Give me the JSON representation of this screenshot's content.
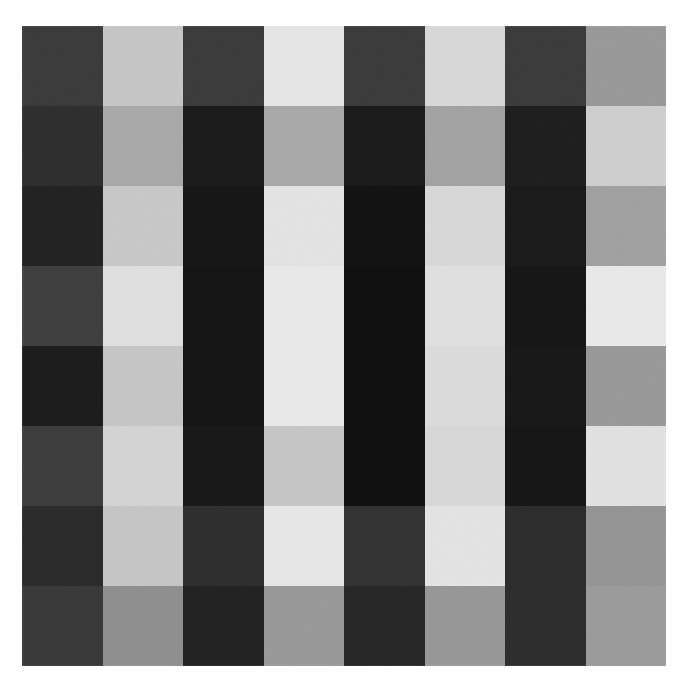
{
  "figure": {
    "caption": "",
    "background_color": "#ffffff",
    "plate": {
      "left": 22,
      "top": 26,
      "width": 644,
      "height": 640,
      "rows": 8,
      "cols": 8
    }
  },
  "palette": {
    "darkest": "#151515",
    "dark": "#2e2e2e",
    "mid_dark": "#3d3d3d",
    "mid": "#808080",
    "mid_light": "#a9a9a9",
    "light": "#c8c8c8",
    "lightest": "#ececec",
    "paper": "#ffffff"
  },
  "chart_data": {
    "type": "heatmap",
    "xlabel": "",
    "ylabel": "",
    "x": [
      "c1",
      "c2",
      "c3",
      "c4",
      "c5",
      "c6",
      "c7",
      "c8"
    ],
    "y": [
      "r1",
      "r2",
      "r3",
      "r4",
      "r5",
      "r6",
      "r7",
      "r8"
    ],
    "grid": false,
    "legend": "none",
    "value_range": [
      8,
      240
    ],
    "colormap": "grayscale",
    "column_phase": [
      "dark",
      "light",
      "dark",
      "light",
      "dark",
      "light",
      "dark",
      "light"
    ],
    "row_contrast": [
      0.55,
      0.8,
      0.95,
      1.0,
      1.0,
      0.95,
      0.78,
      0.52
    ],
    "values": [
      [
        58,
        196,
        58,
        228,
        58,
        214,
        58,
        150
      ],
      [
        46,
        166,
        26,
        166,
        26,
        160,
        30,
        205
      ],
      [
        34,
        198,
        22,
        226,
        18,
        214,
        26,
        158
      ],
      [
        62,
        222,
        20,
        232,
        16,
        222,
        22,
        232
      ],
      [
        28,
        196,
        20,
        232,
        16,
        218,
        24,
        150
      ],
      [
        60,
        210,
        24,
        196,
        16,
        214,
        22,
        224
      ],
      [
        42,
        196,
        46,
        230,
        50,
        226,
        44,
        146
      ],
      [
        56,
        140,
        34,
        150,
        38,
        148,
        44,
        152
      ]
    ],
    "cell_hex": [
      [
        "#3a3a3a",
        "#c4c4c4",
        "#3a3a3a",
        "#e4e4e4",
        "#3a3a3a",
        "#d6d6d6",
        "#3a3a3a",
        "#969696"
      ],
      [
        "#2e2e2e",
        "#a6a6a6",
        "#1a1a1a",
        "#a6a6a6",
        "#1a1a1a",
        "#a0a0a0",
        "#1e1e1e",
        "#cdcdcd"
      ],
      [
        "#222222",
        "#c6c6c6",
        "#161616",
        "#e2e2e2",
        "#121212",
        "#d6d6d6",
        "#1a1a1a",
        "#9e9e9e"
      ],
      [
        "#3e3e3e",
        "#dedede",
        "#141414",
        "#e8e8e8",
        "#101010",
        "#dedede",
        "#161616",
        "#e8e8e8"
      ],
      [
        "#1c1c1c",
        "#c4c4c4",
        "#141414",
        "#e8e8e8",
        "#101010",
        "#dadada",
        "#181818",
        "#969696"
      ],
      [
        "#3c3c3c",
        "#d2d2d2",
        "#181818",
        "#c4c4c4",
        "#101010",
        "#d6d6d6",
        "#161616",
        "#e0e0e0"
      ],
      [
        "#2a2a2a",
        "#c4c4c4",
        "#2e2e2e",
        "#e6e6e6",
        "#323232",
        "#e2e2e2",
        "#2c2c2c",
        "#929292"
      ],
      [
        "#383838",
        "#8c8c8c",
        "#222222",
        "#969696",
        "#262626",
        "#949494",
        "#2c2c2c",
        "#989898"
      ]
    ]
  }
}
